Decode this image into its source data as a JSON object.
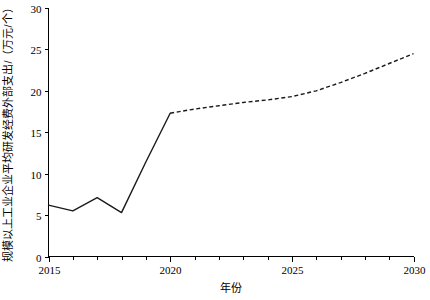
{
  "chart_data": {
    "type": "line",
    "title": "",
    "xlabel": "年份",
    "ylabel": "规模以上工业企业平均研发经费外部支出/（万元/个）",
    "xlim": [
      2015,
      2030
    ],
    "ylim": [
      0,
      30
    ],
    "grid": false,
    "legend": "none",
    "x_ticks_major": [
      2015,
      2020,
      2025,
      2030
    ],
    "x_tick_labels": [
      "2015",
      "2020",
      "2025",
      "2030"
    ],
    "x_ticks_minor": [
      2016,
      2017,
      2018,
      2019,
      2021,
      2022,
      2023,
      2024,
      2026,
      2027,
      2028,
      2029
    ],
    "y_ticks": [
      0,
      5,
      10,
      15,
      20,
      25,
      30
    ],
    "y_tick_labels": [
      "0",
      "5",
      "10",
      "15",
      "20",
      "25",
      "30"
    ],
    "series": [
      {
        "name": "历史值",
        "style": "solid",
        "x": [
          2015,
          2016,
          2017,
          2018,
          2019,
          2020
        ],
        "values": [
          6.2,
          5.5,
          7.1,
          5.3,
          11.4,
          17.3
        ]
      },
      {
        "name": "预测值",
        "style": "dashed",
        "x": [
          2020,
          2021,
          2022,
          2023,
          2024,
          2025,
          2026,
          2027,
          2028,
          2029,
          2030
        ],
        "values": [
          17.3,
          17.8,
          18.2,
          18.6,
          18.9,
          19.3,
          20.0,
          21.0,
          22.1,
          23.3,
          24.5
        ]
      }
    ],
    "colors": {
      "line": "#1a1a1a",
      "axis": "#000000",
      "background": "#ffffff"
    }
  }
}
